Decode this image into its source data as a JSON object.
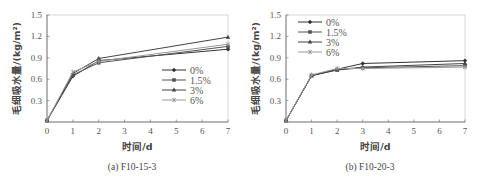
{
  "chart_data": [
    {
      "type": "line",
      "caption": "(a) F10-15-3",
      "xlabel": "时间/d",
      "ylabel": "毛细吸水量/(kg/m²)",
      "xlim": [
        0,
        7
      ],
      "ylim": [
        0,
        1.5
      ],
      "xticks": [
        "0",
        "1",
        "2",
        "3",
        "4",
        "5",
        "6",
        "7"
      ],
      "yticks": [
        "0.3",
        "0.6",
        "0.9",
        "1.2",
        "1.5"
      ],
      "grid": false,
      "legend_position": "lower right",
      "x": [
        0,
        1,
        2,
        7
      ],
      "series": [
        {
          "name": "0%",
          "marker": "diamond",
          "values": [
            0.02,
            0.64,
            0.86,
            1.02
          ]
        },
        {
          "name": "1.5%",
          "marker": "square",
          "values": [
            0.02,
            0.66,
            0.83,
            1.06
          ]
        },
        {
          "name": "3%",
          "marker": "triangle",
          "values": [
            0.02,
            0.68,
            0.89,
            1.19
          ]
        },
        {
          "name": "6%",
          "marker": "star",
          "values": [
            0.02,
            0.7,
            0.85,
            1.09
          ]
        }
      ]
    },
    {
      "type": "line",
      "caption": "(b) F10-20-3",
      "xlabel": "时间/d",
      "ylabel": "毛细吸水量/(kg/m²)",
      "xlim": [
        0,
        7
      ],
      "ylim": [
        0,
        1.5
      ],
      "xticks": [
        "0",
        "1",
        "2",
        "3",
        "4",
        "5",
        "6",
        "7"
      ],
      "yticks": [
        "0.3",
        "0.6",
        "0.9",
        "1.2",
        "1.5"
      ],
      "grid": false,
      "legend_position": "upper left",
      "x": [
        0,
        1,
        2,
        3,
        7
      ],
      "series": [
        {
          "name": "0%",
          "marker": "diamond",
          "values": [
            0.02,
            0.65,
            0.74,
            0.82,
            0.86
          ]
        },
        {
          "name": "1.5%",
          "marker": "square",
          "values": [
            0.02,
            0.65,
            0.73,
            0.76,
            0.79
          ]
        },
        {
          "name": "3%",
          "marker": "triangle",
          "values": [
            0.02,
            0.65,
            0.73,
            0.77,
            0.82
          ]
        },
        {
          "name": "6%",
          "marker": "star",
          "values": [
            0.02,
            0.66,
            0.75,
            0.75,
            0.77
          ]
        }
      ]
    }
  ],
  "colors": {
    "series": [
      "#333333",
      "#555555",
      "#444444",
      "#999999"
    ],
    "axis": "#666666"
  }
}
